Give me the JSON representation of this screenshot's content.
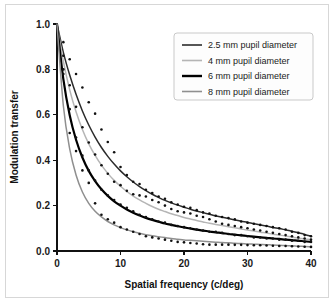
{
  "figure": {
    "background_color": "#ffffff",
    "border_color": "#d7d7d7"
  },
  "chart_data": {
    "type": "line",
    "title": "",
    "xlabel": "Spatial frequency (c/deg)",
    "ylabel": "Modulation transfer",
    "xlim": [
      0,
      40
    ],
    "ylim": [
      0.0,
      1.0
    ],
    "xticks": [
      0,
      10,
      20,
      30,
      40
    ],
    "xtick_labels": [
      "0",
      "10",
      "20",
      "30",
      "40"
    ],
    "yticks": [
      0.0,
      0.2,
      0.4,
      0.6,
      0.8,
      1.0
    ],
    "ytick_labels": [
      "0.0",
      "0.2",
      "0.4",
      "0.6",
      "0.8",
      "1.0"
    ],
    "grid": false,
    "legend_position": "upper right",
    "x": [
      0,
      1,
      2,
      3,
      4,
      5,
      6,
      7,
      8,
      9,
      10,
      11,
      12,
      13,
      14,
      15,
      16,
      17,
      18,
      19,
      20,
      21,
      22,
      23,
      24,
      25,
      26,
      27,
      28,
      29,
      30,
      31,
      32,
      33,
      34,
      35,
      36,
      37,
      38,
      39,
      40
    ],
    "series": [
      {
        "name": "2.5 mm pupil diameter",
        "color": "#2b2b2b",
        "line_width": 1.5,
        "values": [
          1.0,
          0.875,
          0.775,
          0.69,
          0.617,
          0.555,
          0.502,
          0.456,
          0.417,
          0.383,
          0.353,
          0.327,
          0.304,
          0.284,
          0.266,
          0.25,
          0.236,
          0.223,
          0.212,
          0.202,
          0.193,
          0.184,
          0.176,
          0.169,
          0.162,
          0.155,
          0.149,
          0.143,
          0.137,
          0.131,
          0.126,
          0.12,
          0.115,
          0.11,
          0.104,
          0.099,
          0.093,
          0.087,
          0.08,
          0.073,
          0.065
        ],
        "points": [
          1.0,
          0.92,
          0.845,
          0.78,
          0.72,
          0.655,
          0.605,
          0.535,
          0.48,
          0.435,
          0.37,
          0.335,
          0.305,
          0.295,
          0.27,
          0.255,
          0.24,
          0.23,
          0.215,
          0.205,
          0.195,
          0.19,
          0.18,
          0.17,
          0.165,
          0.155,
          0.15,
          0.145,
          0.14,
          0.13,
          0.125,
          0.12,
          0.115,
          0.11,
          0.105,
          0.1,
          0.095,
          0.085,
          0.08,
          0.07,
          0.065
        ]
      },
      {
        "name": "4 mm pupil diameter",
        "color": "#b5b5b5",
        "line_width": 1.5,
        "values": [
          1.0,
          0.835,
          0.71,
          0.613,
          0.535,
          0.472,
          0.421,
          0.378,
          0.342,
          0.311,
          0.285,
          0.262,
          0.242,
          0.225,
          0.21,
          0.196,
          0.184,
          0.174,
          0.164,
          0.156,
          0.148,
          0.141,
          0.134,
          0.128,
          0.122,
          0.117,
          0.112,
          0.107,
          0.102,
          0.097,
          0.092,
          0.088,
          0.083,
          0.079,
          0.074,
          0.07,
          0.066,
          0.061,
          0.057,
          0.053,
          0.05
        ],
        "points": [
          1.0,
          0.86,
          0.73,
          0.635,
          0.545,
          0.478,
          0.425,
          0.378,
          0.34,
          0.305,
          0.29,
          0.265,
          0.25,
          0.245,
          0.24,
          0.225,
          0.215,
          0.2,
          0.185,
          0.175,
          0.17,
          0.165,
          0.155,
          0.15,
          0.14,
          0.13,
          0.12,
          0.115,
          0.11,
          0.105,
          0.1,
          0.095,
          0.09,
          0.085,
          0.08,
          0.075,
          0.07,
          0.065,
          0.06,
          0.055,
          0.05
        ]
      },
      {
        "name": "6 mm pupil diameter",
        "color": "#000000",
        "line_width": 2.2,
        "values": [
          1.0,
          0.757,
          0.598,
          0.49,
          0.412,
          0.353,
          0.308,
          0.272,
          0.243,
          0.219,
          0.2,
          0.183,
          0.169,
          0.157,
          0.146,
          0.137,
          0.129,
          0.121,
          0.115,
          0.109,
          0.104,
          0.099,
          0.094,
          0.09,
          0.086,
          0.082,
          0.079,
          0.075,
          0.072,
          0.069,
          0.066,
          0.063,
          0.06,
          0.058,
          0.055,
          0.053,
          0.05,
          0.048,
          0.045,
          0.043,
          0.04
        ],
        "points": [
          1.0,
          0.8,
          0.625,
          0.5,
          0.42,
          0.355,
          0.31,
          0.27,
          0.245,
          0.225,
          0.205,
          0.19,
          0.175,
          0.16,
          0.15,
          0.14,
          0.13,
          0.125,
          0.115,
          0.11,
          0.105,
          0.1,
          0.095,
          0.09,
          0.085,
          0.085,
          0.08,
          0.075,
          0.07,
          0.07,
          0.065,
          0.06,
          0.06,
          0.055,
          0.055,
          0.05,
          0.05,
          0.045,
          0.045,
          0.04,
          0.04
        ]
      },
      {
        "name": "8 mm pupil diameter",
        "color": "#8f8f8f",
        "line_width": 1.5,
        "values": [
          1.0,
          0.64,
          0.45,
          0.335,
          0.26,
          0.21,
          0.175,
          0.15,
          0.13,
          0.115,
          0.103,
          0.093,
          0.085,
          0.078,
          0.072,
          0.067,
          0.063,
          0.059,
          0.055,
          0.052,
          0.049,
          0.047,
          0.045,
          0.043,
          0.041,
          0.039,
          0.037,
          0.036,
          0.034,
          0.033,
          0.031,
          0.03,
          0.029,
          0.028,
          0.026,
          0.025,
          0.024,
          0.023,
          0.021,
          0.02,
          0.018
        ],
        "points": [
          1.0,
          0.78,
          0.52,
          0.44,
          0.355,
          0.3,
          0.21,
          0.16,
          0.14,
          0.125,
          0.105,
          0.095,
          0.085,
          0.075,
          0.065,
          0.06,
          0.055,
          0.05,
          0.045,
          0.04,
          0.038,
          0.035,
          0.033,
          0.03,
          0.028,
          0.028,
          0.028,
          0.028,
          0.027,
          0.027,
          0.026,
          0.025,
          0.025,
          0.024,
          0.023,
          0.022,
          0.022,
          0.021,
          0.02,
          0.019,
          0.018
        ]
      }
    ]
  },
  "legend": {
    "entries": [
      {
        "label": "2.5 mm pupil diameter",
        "color": "#2b2b2b",
        "line_width": 1.6
      },
      {
        "label": "4 mm pupil diameter",
        "color": "#b5b5b5",
        "line_width": 1.6
      },
      {
        "label": "6 mm pupil diameter",
        "color": "#000000",
        "line_width": 2.4
      },
      {
        "label": "8 mm pupil diameter",
        "color": "#8f8f8f",
        "line_width": 1.6
      }
    ]
  }
}
